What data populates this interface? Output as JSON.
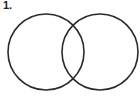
{
  "problem": {
    "number_label": "1."
  },
  "diagram": {
    "type": "venn",
    "stroke_color": "#2a2a2a",
    "circles": [
      {
        "name": "left",
        "cx": 46,
        "cy": 52,
        "r": 38
      },
      {
        "name": "right",
        "cx": 100,
        "cy": 52,
        "r": 38
      }
    ]
  }
}
